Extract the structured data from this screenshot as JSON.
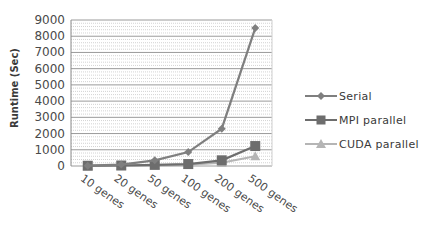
{
  "chart_data": {
    "type": "line",
    "title": "",
    "xlabel": "",
    "ylabel": "Runtime (Sec)",
    "ylim": [
      0,
      9000
    ],
    "yticks": [
      0,
      1000,
      2000,
      3000,
      4000,
      5000,
      6000,
      7000,
      8000,
      9000
    ],
    "categories": [
      "10 genes",
      "20 genes",
      "50 genes",
      "100 genes",
      "200 genes",
      "500 genes"
    ],
    "grid": true,
    "legend_position": "right",
    "series": [
      {
        "name": "Serial",
        "marker": "diamond",
        "color": "#7f7f7f",
        "values": [
          20,
          90,
          350,
          860,
          2300,
          8500
        ]
      },
      {
        "name": "MPI parallel",
        "marker": "square",
        "color": "#6d6d6d",
        "values": [
          15,
          30,
          70,
          120,
          350,
          1230
        ]
      },
      {
        "name": "CUDA parallel",
        "marker": "triangle",
        "color": "#b5b5b5",
        "values": [
          10,
          20,
          40,
          80,
          200,
          600
        ]
      }
    ]
  },
  "legend": {
    "items": [
      "Serial",
      "MPI parallel",
      "CUDA parallel"
    ]
  }
}
